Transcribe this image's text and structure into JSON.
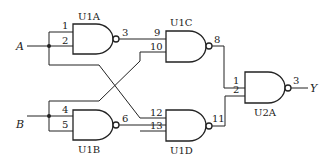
{
  "diagram": {
    "type": "logic-circuit",
    "inputs": {
      "a": "A",
      "b": "B"
    },
    "output": "Y",
    "gates": {
      "u1a": {
        "label": "U1A",
        "in1": "1",
        "in2": "2",
        "out": "3"
      },
      "u1b": {
        "label": "U1B",
        "in1": "4",
        "in2": "5",
        "out": "6"
      },
      "u1c": {
        "label": "U1C",
        "in1": "9",
        "in2": "10",
        "out": "8"
      },
      "u1d": {
        "label": "U1D",
        "in1": "12",
        "in2": "13",
        "out": "11"
      },
      "u2a": {
        "label": "U2A",
        "in1": "1",
        "in2": "2",
        "out": "3"
      }
    }
  }
}
